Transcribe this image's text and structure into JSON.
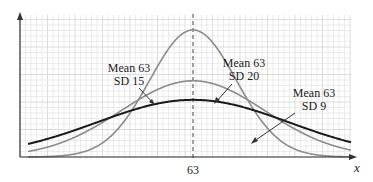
{
  "chart_data": {
    "type": "line",
    "title": "",
    "xlabel": "x",
    "ylabel": "",
    "x_tick_labels": [
      "63"
    ],
    "mean_line": {
      "x": 63,
      "style": "dashed",
      "label": "63"
    },
    "grid": true,
    "legend": "none (curves labeled directly with arrows)",
    "series": [
      {
        "name": "Mean 63 SD 9",
        "mean": 63,
        "sd": 9,
        "color": "#8c8c8c",
        "stroke_width": 1.6,
        "label_line1": "Mean 63",
        "label_line2": "SD 9"
      },
      {
        "name": "Mean 63 SD 15",
        "mean": 63,
        "sd": 15,
        "color": "#8c8c8c",
        "stroke_width": 1.6,
        "label_line1": "Mean 63",
        "label_line2": "SD 15"
      },
      {
        "name": "Mean 63 SD 20",
        "mean": 63,
        "sd": 20,
        "color": "#1a1a1a",
        "stroke_width": 2.0,
        "label_line1": "Mean 63",
        "label_line2": "SD 20"
      }
    ]
  },
  "colors": {
    "grid_minor": "#e4e4e4",
    "grid_major": "#cfcfcf",
    "axis": "#333333",
    "mean_line": "#444444"
  }
}
